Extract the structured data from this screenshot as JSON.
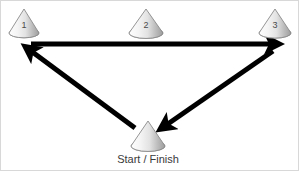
{
  "diagram": {
    "background_color": "#ffffff",
    "border_color": "#d8d8d8",
    "arrow_color": "#000000",
    "cone_outline_color": "#8a8a8a",
    "cone_fill_light": "#fcfcfc",
    "cone_fill_dark": "#9d9d9d",
    "label_color": "#4a4a4a",
    "caption_color": "#3a3a3a"
  },
  "cones": [
    {
      "id": "cone-1",
      "label": "1",
      "apex_x": 23,
      "apex_y": 8,
      "base_left_x": 8,
      "base_right_x": 38,
      "base_y": 32,
      "label_x": 23,
      "label_y": 27
    },
    {
      "id": "cone-2",
      "label": "2",
      "apex_x": 145,
      "apex_y": 8,
      "base_left_x": 128,
      "base_right_x": 162,
      "base_y": 32,
      "label_x": 145,
      "label_y": 27
    },
    {
      "id": "cone-3",
      "label": "3",
      "apex_x": 274,
      "apex_y": 8,
      "base_left_x": 258,
      "base_right_x": 290,
      "base_y": 32,
      "label_x": 274,
      "label_y": 27
    },
    {
      "id": "cone-start-finish",
      "label": "",
      "apex_x": 147,
      "apex_y": 120,
      "base_left_x": 130,
      "base_right_x": 164,
      "base_y": 145,
      "label_x": 147,
      "label_y": 140
    }
  ],
  "caption": {
    "text": "Start / Finish",
    "x": 147,
    "y": 162
  },
  "arrows": [
    {
      "id": "arrow-cone1-to-cone3",
      "from": "cone-1",
      "to": "cone-3",
      "x1": 30,
      "y1": 43,
      "x2": 276,
      "y2": 43,
      "width": 5
    },
    {
      "id": "arrow-cone3-to-start",
      "from": "cone-3",
      "to": "cone-start-finish",
      "x1": 272,
      "y1": 50,
      "x2": 161,
      "y2": 127,
      "width": 5
    },
    {
      "id": "arrow-start-to-cone1",
      "from": "cone-start-finish",
      "to": "cone-1",
      "x1": 134,
      "y1": 127,
      "x2": 26,
      "y2": 47,
      "width": 5
    }
  ]
}
